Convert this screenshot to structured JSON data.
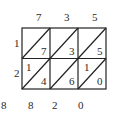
{
  "diagram": {
    "type": "lattice-multiplication",
    "multiplicand_digits": [
      "7",
      "3",
      "5"
    ],
    "multiplier_digits": [
      "1",
      "2"
    ],
    "cells": [
      [
        {
          "tens": "",
          "ones": "7"
        },
        {
          "tens": "",
          "ones": "3"
        },
        {
          "tens": "",
          "ones": "5"
        }
      ],
      [
        {
          "tens": "1",
          "ones": "4"
        },
        {
          "tens": "",
          "ones": "6"
        },
        {
          "tens": "1",
          "ones": "0"
        }
      ]
    ],
    "result_digits": [
      "8",
      "8",
      "2",
      "0"
    ],
    "line_color": "#222222",
    "text_color": "#2a2a2a"
  }
}
